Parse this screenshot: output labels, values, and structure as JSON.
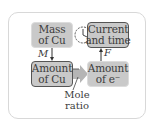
{
  "diagram": {
    "type": "flow",
    "boxes": {
      "mass_cu": {
        "line1": "Mass",
        "line2": "of Cu"
      },
      "current_time": {
        "line1": "Current",
        "line2": "and time"
      },
      "amount_cu": {
        "line1": "Amount",
        "line2": "of Cu"
      },
      "amount_e": {
        "line1": "Amount",
        "line2": "of e⁻"
      }
    },
    "arrows": {
      "mass_to_amount_label": "M",
      "amount_e_to_current_label": "F"
    },
    "mole_ratio": {
      "line1": "Mole",
      "line2": "ratio"
    },
    "icons": {
      "clock": "clock-icon"
    },
    "colors": {
      "box_fill": "#c9c9c9",
      "box_dark_border": "#555555",
      "box_light_border": "#dcdcdc",
      "arrow_fill": "#b5b5b5",
      "text": "#3c3c3c",
      "panel_border": "#d8d8d8"
    }
  }
}
